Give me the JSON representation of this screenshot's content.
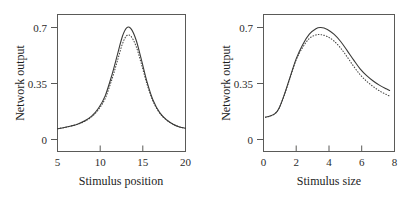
{
  "figure": {
    "background": "#ffffff",
    "axis_color": "#5a5a58",
    "curve_color": "#3a3a38"
  },
  "chart_data": [
    {
      "type": "line",
      "panel": "left",
      "title": "",
      "xlabel": "Stimulus position",
      "ylabel": "Network output",
      "xlim": [
        5,
        20
      ],
      "ylim": [
        -0.09,
        0.78
      ],
      "xticks": [
        5,
        10,
        15,
        20
      ],
      "xticklabels": [
        "5",
        "10",
        "15",
        "20"
      ],
      "yticks": [
        0,
        0.35,
        0.7
      ],
      "yticklabels": [
        "0",
        "0.35",
        "0.7"
      ],
      "grid": false,
      "legend": "none",
      "series": [
        {
          "name": "solid",
          "style": "solid",
          "x": [
            5.0,
            5.8,
            6.6,
            7.4,
            8.2,
            9.0,
            9.8,
            10.6,
            11.4,
            12.0,
            12.6,
            13.1,
            13.6,
            14.2,
            14.8,
            15.5,
            16.2,
            17.0,
            17.8,
            18.6,
            19.3,
            20.0
          ],
          "y": [
            0.055,
            0.062,
            0.072,
            0.085,
            0.105,
            0.135,
            0.185,
            0.265,
            0.4,
            0.52,
            0.64,
            0.695,
            0.69,
            0.62,
            0.5,
            0.35,
            0.235,
            0.155,
            0.11,
            0.082,
            0.066,
            0.058
          ]
        },
        {
          "name": "dotted",
          "style": "dotted",
          "x": [
            5.0,
            5.8,
            6.6,
            7.4,
            8.2,
            9.0,
            9.8,
            10.6,
            11.4,
            12.0,
            12.6,
            13.1,
            13.6,
            14.2,
            14.8,
            15.5,
            16.2,
            17.0,
            17.8,
            18.6,
            19.3,
            20.0
          ],
          "y": [
            0.055,
            0.062,
            0.072,
            0.084,
            0.102,
            0.13,
            0.176,
            0.248,
            0.372,
            0.482,
            0.592,
            0.645,
            0.642,
            0.58,
            0.472,
            0.336,
            0.228,
            0.152,
            0.109,
            0.082,
            0.066,
            0.058
          ]
        }
      ]
    },
    {
      "type": "line",
      "panel": "right",
      "title": "",
      "xlabel": "Stimulus size",
      "ylabel": "Network output",
      "xlim": [
        0,
        8
      ],
      "ylim": [
        -0.09,
        0.78
      ],
      "xticks": [
        0,
        2,
        4,
        6,
        8
      ],
      "xticklabels": [
        "0",
        "2",
        "4",
        "6",
        "8"
      ],
      "yticks": [
        0,
        0.35,
        0.7
      ],
      "yticklabels": [
        "0",
        "0.35",
        "0.7"
      ],
      "grid": false,
      "legend": "none",
      "series": [
        {
          "name": "solid",
          "style": "solid",
          "x": [
            0.12,
            0.4,
            0.7,
            0.95,
            1.25,
            1.6,
            2.0,
            2.4,
            2.8,
            3.2,
            3.5,
            3.9,
            4.3,
            4.7,
            5.1,
            5.5,
            5.9,
            6.3,
            6.7,
            7.1,
            7.5,
            7.7
          ],
          "y": [
            0.128,
            0.135,
            0.15,
            0.185,
            0.265,
            0.375,
            0.5,
            0.59,
            0.655,
            0.69,
            0.697,
            0.685,
            0.655,
            0.61,
            0.552,
            0.492,
            0.435,
            0.392,
            0.358,
            0.33,
            0.308,
            0.298
          ]
        },
        {
          "name": "dotted",
          "style": "dotted",
          "x": [
            0.12,
            0.4,
            0.7,
            0.95,
            1.25,
            1.6,
            2.0,
            2.4,
            2.8,
            3.2,
            3.5,
            3.9,
            4.3,
            4.7,
            5.1,
            5.5,
            5.9,
            6.3,
            6.7,
            7.1,
            7.5,
            7.7
          ],
          "y": [
            0.128,
            0.135,
            0.15,
            0.185,
            0.262,
            0.37,
            0.492,
            0.572,
            0.628,
            0.65,
            0.652,
            0.64,
            0.612,
            0.568,
            0.512,
            0.452,
            0.398,
            0.356,
            0.322,
            0.294,
            0.272,
            0.262
          ]
        }
      ]
    }
  ]
}
